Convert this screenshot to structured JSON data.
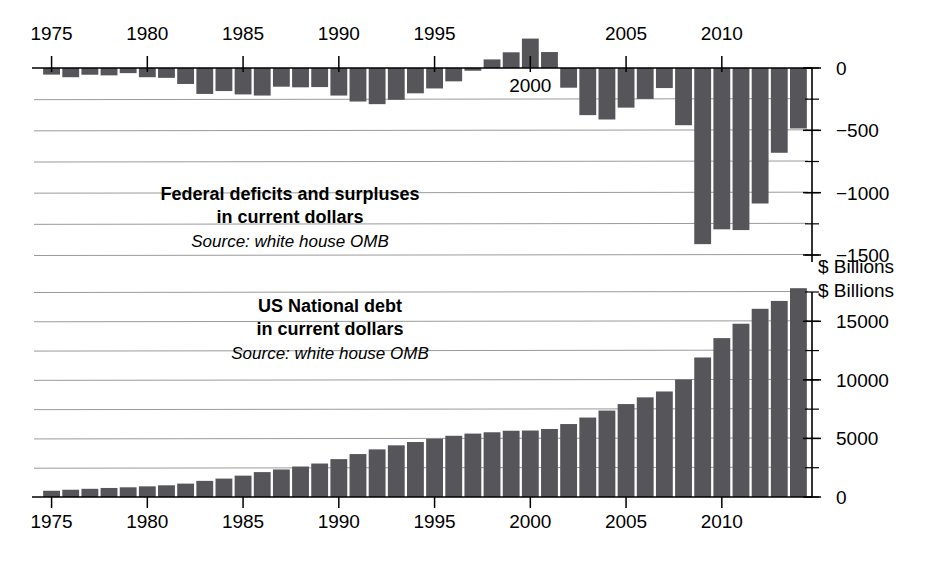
{
  "figure": {
    "units_label_top": "$ Billions",
    "units_label_bottom": "$ Billions"
  },
  "top_panel": {
    "title_line1": "Federal deficits and surpluses",
    "title_line2": "in current dollars",
    "source": "Source: white house OMB"
  },
  "bottom_panel": {
    "title_line1": "US National debt",
    "title_line2": "in current dollars",
    "source": "Source: white house OMB"
  },
  "chart_data": [
    {
      "type": "bar",
      "id": "federal-deficits-surpluses",
      "title": "Federal deficits and surpluses in current dollars",
      "subtitle": "Source: white house OMB",
      "xlabel": "",
      "ylabel": "$ Billions",
      "categories": [
        1975,
        1976,
        1977,
        1978,
        1979,
        1980,
        1981,
        1982,
        1983,
        1984,
        1985,
        1986,
        1987,
        1988,
        1989,
        1990,
        1991,
        1992,
        1993,
        1994,
        1995,
        1996,
        1997,
        1998,
        1999,
        2000,
        2001,
        2002,
        2003,
        2004,
        2005,
        2006,
        2007,
        2008,
        2009,
        2010,
        2011,
        2012,
        2013,
        2014
      ],
      "values": [
        -53,
        -74,
        -54,
        -59,
        -41,
        -74,
        -79,
        -128,
        -208,
        -185,
        -212,
        -221,
        -150,
        -155,
        -153,
        -221,
        -269,
        -290,
        -255,
        -203,
        -164,
        -107,
        -22,
        69,
        126,
        236,
        128,
        -158,
        -378,
        -413,
        -318,
        -248,
        -161,
        -459,
        -1413,
        -1294,
        -1300,
        -1087,
        -680,
        -485
      ],
      "ytick_labels": [
        "0",
        "-500",
        "-1000",
        "-1500"
      ],
      "ytick_values": [
        0,
        -500,
        -1000,
        -1500
      ],
      "yminor_step": 250,
      "ylim": [
        -1625,
        275
      ],
      "xtick_labels": [
        "1975",
        "1980",
        "1985",
        "1990",
        "1995",
        "2000",
        "2005",
        "2010"
      ],
      "xtick_values": [
        1975,
        1980,
        1985,
        1990,
        1995,
        2000,
        2005,
        2010
      ],
      "grid": true,
      "legend": "none",
      "bar_color": "#56565a"
    },
    {
      "type": "bar",
      "id": "us-national-debt",
      "title": "US National debt in current dollars",
      "subtitle": "Source: white house OMB",
      "xlabel": "",
      "ylabel": "$ Billions",
      "categories": [
        1975,
        1976,
        1977,
        1978,
        1979,
        1980,
        1981,
        1982,
        1983,
        1984,
        1985,
        1986,
        1987,
        1988,
        1989,
        1990,
        1991,
        1992,
        1993,
        1994,
        1995,
        1996,
        1997,
        1998,
        1999,
        2000,
        2001,
        2002,
        2003,
        2004,
        2005,
        2006,
        2007,
        2008,
        2009,
        2010,
        2011,
        2012,
        2013,
        2014
      ],
      "values": [
        533,
        620,
        699,
        772,
        827,
        908,
        998,
        1142,
        1377,
        1572,
        1823,
        2125,
        2350,
        2602,
        2857,
        3233,
        3665,
        4065,
        4411,
        4693,
        4974,
        5225,
        5413,
        5526,
        5656,
        5674,
        5807,
        6228,
        6783,
        7379,
        7933,
        8507,
        9008,
        10025,
        11910,
        13562,
        14790,
        16066,
        16738,
        17824
      ],
      "ytick_labels": [
        "0",
        "5000",
        "10000",
        "15000"
      ],
      "ytick_values": [
        0,
        5000,
        10000,
        15000
      ],
      "yminor_step": 2500,
      "ylim": [
        0,
        18900
      ],
      "xtick_labels": [
        "1975",
        "1980",
        "1985",
        "1990",
        "1995",
        "2000",
        "2005",
        "2010"
      ],
      "xtick_values": [
        1975,
        1980,
        1985,
        1990,
        1995,
        2000,
        2005,
        2010
      ],
      "grid": true,
      "legend": "none",
      "bar_color": "#56565a"
    }
  ]
}
